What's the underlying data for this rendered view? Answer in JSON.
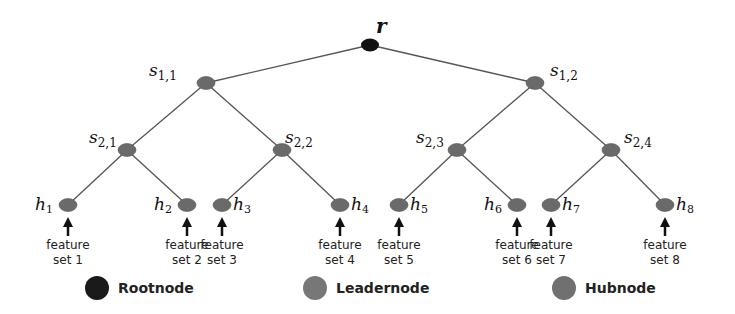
{
  "diagram": {
    "type": "tree",
    "colors": {
      "edge": "#555555",
      "root": "#111111",
      "leader": "#6a6a6a",
      "hub": "#6a6a6a",
      "arrow": "#111111"
    },
    "root": {
      "id": "r",
      "label": "r",
      "x": 370,
      "y": 45
    },
    "leaders": [
      {
        "id": "s11",
        "label": "s",
        "sub": "1,1",
        "x": 206,
        "y": 83,
        "parent": "r",
        "lx": 149,
        "ly": 76
      },
      {
        "id": "s12",
        "label": "s",
        "sub": "1,2",
        "x": 535,
        "y": 83,
        "parent": "r",
        "lx": 550,
        "ly": 76
      },
      {
        "id": "s21",
        "label": "s",
        "sub": "2,1",
        "x": 127,
        "y": 150,
        "parent": "s11",
        "lx": 89,
        "ly": 143
      },
      {
        "id": "s22",
        "label": "s",
        "sub": "2,2",
        "x": 282,
        "y": 150,
        "parent": "s11",
        "lx": 285,
        "ly": 143
      },
      {
        "id": "s23",
        "label": "s",
        "sub": "2,3",
        "x": 457,
        "y": 150,
        "parent": "s12",
        "lx": 416,
        "ly": 143
      },
      {
        "id": "s24",
        "label": "s",
        "sub": "2,4",
        "x": 611,
        "y": 150,
        "parent": "s12",
        "lx": 624,
        "ly": 143
      }
    ],
    "hubs": [
      {
        "id": "h1",
        "label": "h",
        "sub": "1",
        "x": 68,
        "y": 205,
        "parent": "s21",
        "side": "left",
        "feature": [
          "feature",
          "set 1"
        ]
      },
      {
        "id": "h2",
        "label": "h",
        "sub": "2",
        "x": 187,
        "y": 205,
        "parent": "s21",
        "side": "left",
        "feature": [
          "feature",
          "set 2"
        ]
      },
      {
        "id": "h3",
        "label": "h",
        "sub": "3",
        "x": 222,
        "y": 205,
        "parent": "s22",
        "side": "right",
        "feature": [
          "feature",
          "set 3"
        ]
      },
      {
        "id": "h4",
        "label": "h",
        "sub": "4",
        "x": 340,
        "y": 205,
        "parent": "s22",
        "side": "right",
        "feature": [
          "feature",
          "set 4"
        ]
      },
      {
        "id": "h5",
        "label": "h",
        "sub": "5",
        "x": 399,
        "y": 205,
        "parent": "s23",
        "side": "right",
        "feature": [
          "feature",
          "set 5"
        ]
      },
      {
        "id": "h6",
        "label": "h",
        "sub": "6",
        "x": 517,
        "y": 205,
        "parent": "s23",
        "side": "left",
        "feature": [
          "feature",
          "set 6"
        ]
      },
      {
        "id": "h7",
        "label": "h",
        "sub": "7",
        "x": 551,
        "y": 205,
        "parent": "s24",
        "side": "right",
        "feature": [
          "feature",
          "set 7"
        ]
      },
      {
        "id": "h8",
        "label": "h",
        "sub": "8",
        "x": 665,
        "y": 205,
        "parent": "s24",
        "side": "right",
        "feature": [
          "feature",
          "set 8"
        ]
      }
    ]
  },
  "legend": [
    {
      "label": "Rootnode",
      "color": "#1a1a1a",
      "x": 97,
      "y": 288
    },
    {
      "label": "Leadernode",
      "color": "#777777",
      "x": 315,
      "y": 288
    },
    {
      "label": "Hubnode",
      "color": "#707070",
      "x": 564,
      "y": 288
    }
  ]
}
